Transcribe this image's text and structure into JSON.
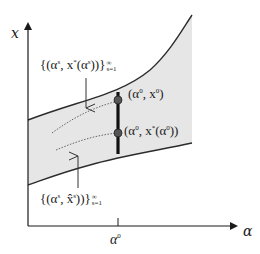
{
  "diagram": {
    "axes": {
      "y_label": "x",
      "x_label": "α",
      "x_tick_label": "α",
      "x_tick_label_sup": "0"
    },
    "labels": {
      "upper_sequence": {
        "open": "{(α",
        "sup1": "s",
        "mid": ", x",
        "sup2": "*",
        "mid2": "(α",
        "sup3": "s",
        "close": "))}",
        "sup_end": "∞",
        "sub_end": "s=1"
      },
      "lower_sequence": {
        "open": "{(α",
        "sup1": "s",
        "mid": ", x̂",
        "sup2": "s",
        "close": "))}",
        "sup_end": "∞",
        "sub_end": "s=1"
      },
      "point_upper": {
        "open": "(α",
        "sup1": "0",
        "mid": ", x",
        "sup2": "0",
        "close": ")"
      },
      "point_lower": {
        "open": "(α",
        "sup1": "0",
        "mid": ", x",
        "sup2": "*",
        "mid2": "(α",
        "sup3": "0",
        "close": "))"
      }
    },
    "colors": {
      "band_fill": "#e6e6e6",
      "curve_stroke": "#2b2b2b",
      "dot_fill": "#555555",
      "dotted_path": "#555555"
    }
  }
}
